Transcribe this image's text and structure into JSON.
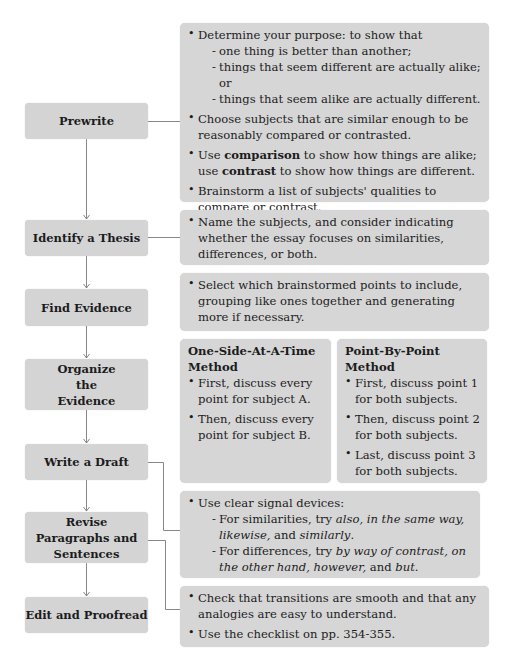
{
  "steps": [
    {
      "label": "Prewrite"
    },
    {
      "label": "Identify a Thesis"
    },
    {
      "label": "Find Evidence"
    },
    {
      "label": "Organize the Evidence"
    },
    {
      "label": "Write a Draft"
    },
    {
      "label": "Revise Paragraphs and Sentences"
    },
    {
      "label": "Edit and Proofread"
    }
  ],
  "prewrite": {
    "b1": "Determine your purpose: to show that",
    "b1_subs": [
      "one thing is better than another;",
      "things that seem different are actually alike; or",
      "things that seem alike are actually different."
    ],
    "b2": "Choose subjects that are similar enough to be reasonably compared or contrasted.",
    "b3_pre": "Use ",
    "b3_bold1": "comparison",
    "b3_mid": " to show how things are alike; use ",
    "b3_bold2": "contrast",
    "b3_post": " to show how things are different.",
    "b4": "Brainstorm a list of subjects' qualities to compare or contrast."
  },
  "thesis": {
    "b1": "Name the subjects, and consider indicating whether the essay focuses on similarities, differences, or both."
  },
  "evidence": {
    "b1": "Select which brainstormed points to include, grouping like ones together and generating more if necessary."
  },
  "organize": {
    "one_side": {
      "title": "One-Side-At-A-Time Method",
      "bullets": [
        "First, discuss every point for subject A.",
        "Then, discuss every point for subject B."
      ]
    },
    "point_by_point": {
      "title": "Point-By-Point Method",
      "bullets": [
        "First, discuss point 1 for both subjects.",
        "Then, discuss point 2 for both subjects.",
        "Last, discuss point 3 for both subjects."
      ]
    }
  },
  "revise": {
    "b1": "Use clear signal devices:",
    "sim_pre": "For similarities, try ",
    "sim_i1": "also, in the same way, likewise,",
    "sim_mid": " and ",
    "sim_i2": "similarly",
    "sim_post": ".",
    "diff_pre": "For differences, try ",
    "diff_i1": "by way of contrast, on the other hand, however,",
    "diff_mid": " and ",
    "diff_i2": "but",
    "diff_post": "."
  },
  "edit": {
    "b1": "Check that transitions are smooth and that any analogies are easy to understand.",
    "b2": "Use the checklist on pp. 354-355."
  },
  "colors": {
    "box": "#d6d6d6",
    "line": "#777777",
    "text": "#1c1c1c"
  }
}
